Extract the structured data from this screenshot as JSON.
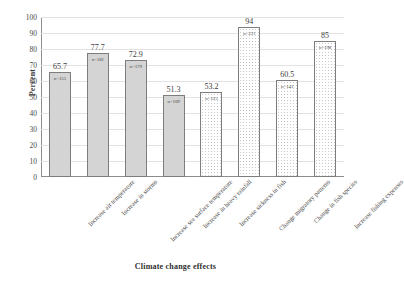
{
  "chart_data": {
    "type": "bar",
    "title": "",
    "xlabel": "Climate change effects",
    "ylabel": "Percent",
    "ylim": [
      0,
      100
    ],
    "ytick_step": 10,
    "yticks": [
      100,
      90,
      80,
      70,
      60,
      50,
      40,
      30,
      20,
      10,
      0
    ],
    "grid": true,
    "legend": "none",
    "categories": [
      "Increase air temperature",
      "Increase in storms",
      "Increase sea surface temperature",
      "Increase in heavy rainfall",
      "Increase sickness in fish",
      "Change migratory patterns",
      "Change in fish species",
      "Increase fishing expenses"
    ],
    "values": [
      65.7,
      77.7,
      72.9,
      51.3,
      53.2,
      94,
      60.5,
      85
    ],
    "value_labels": [
      "65.7",
      "77.7",
      "72.9",
      "51.3",
      "53.2",
      "94",
      "60.5",
      "85"
    ],
    "n_labels": [
      "n=151",
      "n=181",
      "n=179",
      "n=109",
      "n=125",
      "n=221",
      "n=141",
      "n=198"
    ],
    "bar_fills": [
      "solid",
      "solid",
      "solid",
      "solid",
      "dotted",
      "dotted",
      "dotted",
      "dotted"
    ],
    "colors": {
      "bar_solid_fill": "#d4d4d4",
      "bar_dotted_fill": "#ffffff",
      "bar_border": "#7d7d7d",
      "gridline": "#e2e2e2",
      "axis": "#8d8d8d",
      "text": "#3d3d3d",
      "background": "#ffffff"
    }
  }
}
